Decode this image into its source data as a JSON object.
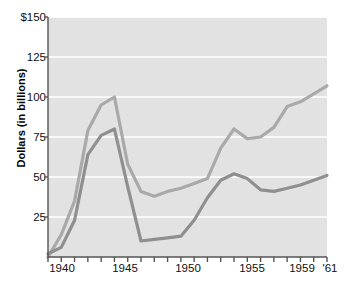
{
  "chart_data": {
    "type": "line",
    "title": "",
    "subtitle": "",
    "xlabel": "",
    "ylabel": "Dollars (in billions)",
    "xlim": [
      1940,
      1961
    ],
    "ylim": [
      0,
      150
    ],
    "grid": true,
    "legend_position": "top-left inside plot",
    "y_ticks": [
      0,
      25,
      50,
      75,
      100,
      125,
      150
    ],
    "y_tick_labels": [
      "",
      "25",
      "50",
      "75",
      "100",
      "125",
      "$150"
    ],
    "x_ticks": [
      1940,
      1941,
      1942,
      1943,
      1944,
      1945,
      1946,
      1947,
      1948,
      1949,
      1950,
      1951,
      1952,
      1953,
      1954,
      1955,
      1956,
      1957,
      1958,
      1959,
      1960,
      1961
    ],
    "x_tick_labels": [
      {
        "year": 1940,
        "label": "1940"
      },
      {
        "year": 1945,
        "label": "1945"
      },
      {
        "year": 1950,
        "label": "1950"
      },
      {
        "year": 1955,
        "label": "1955"
      },
      {
        "year": 1959,
        "label": "1959"
      },
      {
        "year": 1961,
        "label": "'61"
      }
    ],
    "x": [
      1940,
      1941,
      1942,
      1943,
      1944,
      1945,
      1946,
      1947,
      1948,
      1949,
      1950,
      1951,
      1952,
      1953,
      1954,
      1955,
      1956,
      1957,
      1958,
      1959,
      1960,
      1961
    ],
    "series": [
      {
        "name": "Total federal spending",
        "color": "#a9a9a9",
        "values": [
          0,
          14,
          35,
          79,
          95,
          100,
          58,
          41,
          38,
          41,
          43,
          46,
          49,
          68,
          80,
          74,
          75,
          81,
          94,
          97,
          102,
          107
        ]
      },
      {
        "name": "Defense spending",
        "color": "#8f8f8f",
        "values": [
          2,
          6,
          23,
          64,
          76,
          80,
          44,
          10,
          11,
          12,
          13,
          23,
          37,
          48,
          52,
          49,
          42,
          41,
          43,
          45,
          48,
          51
        ]
      }
    ],
    "colors": {
      "plot_background": "#e2e2e2",
      "gridline": "#ffffff",
      "axis": "#555555",
      "text": "#111111",
      "total_federal_spending": "#a9a9a9",
      "defense_spending": "#8f8f8f"
    }
  },
  "legend": {
    "items": [
      {
        "label": "Total federal spending",
        "color": "#a9a9a9"
      },
      {
        "label": "Defense spending",
        "color": "#8f8f8f"
      }
    ]
  },
  "axes": {
    "y_title": "Dollars (in billions)",
    "y_labels": [
      "$150",
      "125",
      "100",
      "75",
      "50",
      "25"
    ],
    "x_labels": [
      "1940",
      "1945",
      "1950",
      "1955",
      "1959",
      "'61"
    ]
  }
}
